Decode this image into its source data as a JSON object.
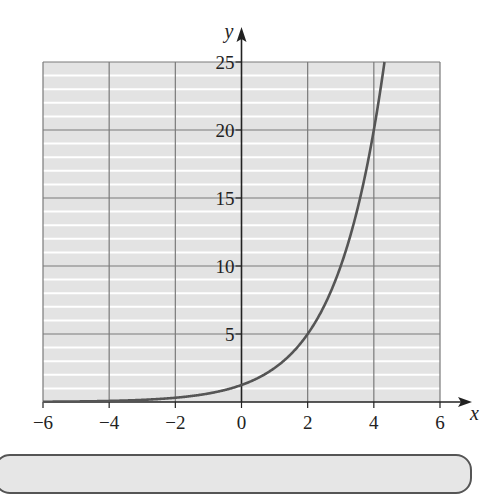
{
  "chart_data": {
    "type": "line",
    "title": "",
    "xlabel": "x",
    "ylabel": "y",
    "xlim": [
      -6,
      6
    ],
    "ylim": [
      0,
      25
    ],
    "x_ticks": [
      -6,
      -4,
      -2,
      0,
      2,
      4,
      6
    ],
    "y_ticks": [
      5,
      10,
      15,
      20,
      25
    ],
    "x_tick_labels": [
      "−6",
      "−4",
      "−2",
      "0",
      "2",
      "4",
      "6"
    ],
    "y_tick_labels": [
      "5",
      "10",
      "15",
      "20",
      "25"
    ],
    "grid": {
      "major_x_step": 2,
      "major_y_step": 5,
      "minor_y_step": 1
    },
    "series": [
      {
        "name": "y = 1.25·2^x",
        "function": "1.25*2^x",
        "x": [
          -6,
          -4,
          -2,
          -1,
          0,
          1,
          2,
          3,
          4,
          4.32
        ],
        "y": [
          0.02,
          0.08,
          0.31,
          0.63,
          1.25,
          2.5,
          5,
          10,
          20,
          25
        ]
      }
    ],
    "legend": null
  },
  "colors": {
    "background": "#ffffff",
    "plot_fill": "#e3e3e3",
    "minor_grid": "#ffffff",
    "major_grid": "#7a7a7a",
    "axis": "#222222",
    "curve": "#555555"
  }
}
